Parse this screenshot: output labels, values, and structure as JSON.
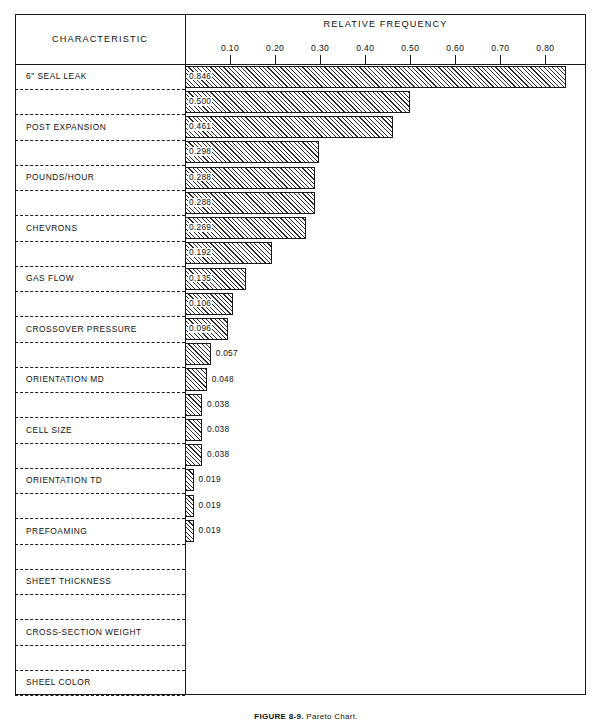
{
  "figure": {
    "caption_bold": "FIGURE 8-9.",
    "caption_rest": "Pareto Chart."
  },
  "header": {
    "characteristic_label": "CHARACTERISTIC",
    "relative_frequency_label": "RELATIVE FREQUENCY"
  },
  "axis": {
    "ticks": [
      "0.10",
      "0.20",
      "0.30",
      "0.40",
      "0.50",
      "0.60",
      "0.70",
      "0.80"
    ],
    "tick_values": [
      0.1,
      0.2,
      0.3,
      0.4,
      0.5,
      0.6,
      0.7,
      0.8
    ],
    "min": 0.0,
    "max": 0.89
  },
  "chart_data": {
    "type": "bar",
    "orientation": "horizontal",
    "title": "",
    "xlabel": "RELATIVE FREQUENCY",
    "ylabel": "CHARACTERISTIC",
    "xlim": [
      0.0,
      0.89
    ],
    "grid": false,
    "legend": "none",
    "categories": [
      "6\" SEAL LEAK",
      "POST EXPANSION",
      "POUNDS/HOUR",
      "CHEVRONS",
      "GAS FLOW",
      "CROSSOVER PRESSURE",
      "ORIENTATION MD",
      "CELL SIZE",
      "ORIENTATION TD",
      "PREFOAMING",
      "SHEET THICKNESS",
      "CROSS-SECTION WEIGHT",
      "SHEEL COLOR",
      "6\" AMP",
      "4½\" RPM",
      "DIE PRESSURE",
      "SWRAP SPEED",
      "GAS RETENTION",
      "6\" BARREL PRESSURE",
      "MELT TEMP #1",
      "MELT TEMP #2",
      "4½\" AMP",
      "6\" RPM",
      "SHEET WIDTH",
      ""
    ],
    "values": [
      0.846,
      0.5,
      0.461,
      0.298,
      0.288,
      0.288,
      0.269,
      0.192,
      0.135,
      0.106,
      0.096,
      0.057,
      0.048,
      0.038,
      0.038,
      0.038,
      0.019,
      0.019,
      0.019,
      0.0,
      0.0,
      0.0,
      0.0,
      0.0,
      0.0
    ],
    "value_labels": [
      "0.846",
      "0.500",
      "0.461",
      "0.298",
      "0.288",
      "0.288",
      "0.269",
      "0.192",
      "0.135",
      "0.106",
      "0.096",
      "0.057",
      "0.048",
      "0.038",
      "0.038",
      "0.038",
      "0.019",
      "0.019",
      "0.019",
      "",
      "",
      "",
      "",
      "",
      ""
    ]
  },
  "rows": [
    {
      "label": "6\" SEAL LEAK",
      "value": 0.846,
      "value_label": "0.846",
      "label_inside": true,
      "fraction": false
    },
    {
      "label": "POST EXPANSION",
      "value": 0.5,
      "value_label": "0.500",
      "label_inside": true,
      "fraction": false
    },
    {
      "label": "POUNDS/HOUR",
      "value": 0.461,
      "value_label": "0.461",
      "label_inside": true,
      "fraction": false
    },
    {
      "label": "CHEVRONS",
      "value": 0.298,
      "value_label": "0.298",
      "label_inside": true,
      "fraction": false
    },
    {
      "label": "GAS FLOW",
      "value": 0.288,
      "value_label": "0.288",
      "label_inside": true,
      "fraction": false
    },
    {
      "label": "CROSSOVER PRESSURE",
      "value": 0.288,
      "value_label": "0.288",
      "label_inside": true,
      "fraction": false
    },
    {
      "label": "ORIENTATION MD",
      "value": 0.269,
      "value_label": "0.269",
      "label_inside": true,
      "fraction": false
    },
    {
      "label": "CELL SIZE",
      "value": 0.192,
      "value_label": "0.192",
      "label_inside": true,
      "fraction": false
    },
    {
      "label": "ORIENTATION TD",
      "value": 0.135,
      "value_label": "0.135",
      "label_inside": true,
      "fraction": false
    },
    {
      "label": "PREFOAMING",
      "value": 0.106,
      "value_label": "0.106",
      "label_inside": true,
      "fraction": false
    },
    {
      "label": "SHEET THICKNESS",
      "value": 0.096,
      "value_label": "0.096",
      "label_inside": true,
      "fraction": false
    },
    {
      "label": "CROSS-SECTION WEIGHT",
      "value": 0.057,
      "value_label": "0.057",
      "label_inside": false,
      "fraction": false
    },
    {
      "label": "SHEEL COLOR",
      "value": 0.048,
      "value_label": "0.048",
      "label_inside": false,
      "fraction": false
    },
    {
      "label": "6\" AMP",
      "value": 0.038,
      "value_label": "0.038",
      "label_inside": false,
      "fraction": false
    },
    {
      "label": "\" RPM",
      "value": 0.038,
      "value_label": "0.038",
      "label_inside": false,
      "fraction": true
    },
    {
      "label": "DIE PRESSURE",
      "value": 0.038,
      "value_label": "0.038",
      "label_inside": false,
      "fraction": false
    },
    {
      "label": "SWRAP SPEED",
      "value": 0.019,
      "value_label": "0.019",
      "label_inside": false,
      "fraction": false
    },
    {
      "label": "GAS RETENTION",
      "value": 0.019,
      "value_label": "0.019",
      "label_inside": false,
      "fraction": false
    },
    {
      "label": "6\" BARREL PRESSURE",
      "value": 0.019,
      "value_label": "0.019",
      "label_inside": false,
      "fraction": false
    },
    {
      "label": "MELT TEMP #1",
      "value": 0,
      "value_label": "",
      "label_inside": false,
      "fraction": false
    },
    {
      "label": "MELT TEMP #2",
      "value": 0,
      "value_label": "",
      "label_inside": false,
      "fraction": false
    },
    {
      "label": "\" AMP",
      "value": 0,
      "value_label": "",
      "label_inside": false,
      "fraction": true
    },
    {
      "label": "6\" RPM",
      "value": 0,
      "value_label": "",
      "label_inside": false,
      "fraction": false
    },
    {
      "label": "SHEET WIDTH",
      "value": 0,
      "value_label": "",
      "label_inside": false,
      "fraction": false
    },
    {
      "label": "",
      "value": 0,
      "value_label": "",
      "label_inside": false,
      "fraction": false
    }
  ],
  "fraction": {
    "whole": "4",
    "numerator": "1",
    "denominator": "2"
  }
}
